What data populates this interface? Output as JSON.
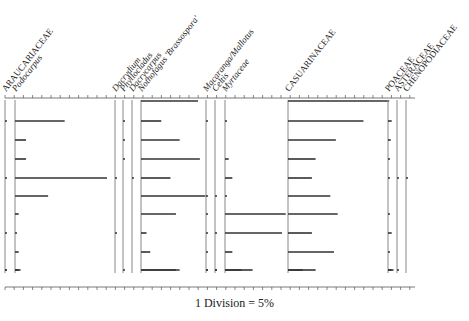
{
  "chart_data": {
    "type": "bar",
    "subtype": "pollen-diagram",
    "title": "",
    "scale_label": "1 Division = 5%",
    "division_percent": 5,
    "orientation": "horizontal bars per taxon column, samples stacked vertically",
    "samples": [
      "S1",
      "S2",
      "S3",
      "S4",
      "S5",
      "S6",
      "S7",
      "S8",
      "S9",
      "S10"
    ],
    "taxa": [
      {
        "name": "ARAUCARIACEAE",
        "style": "family",
        "values": [
          0,
          0.5,
          0,
          0,
          0.5,
          0,
          0,
          0.5,
          0,
          0.5,
          0.5
        ]
      },
      {
        "name": "Podocarpus",
        "style": "genus",
        "values": [
          0,
          27,
          6,
          6,
          50,
          18,
          2,
          0.5,
          2,
          3,
          2
        ]
      },
      {
        "name": "Dacrydium",
        "style": "genus",
        "values": [
          0,
          0,
          0,
          0,
          0.5,
          0,
          0,
          0.5,
          0,
          0,
          0
        ]
      },
      {
        "name": "Phyllocladus",
        "style": "genus",
        "values": [
          0,
          0.5,
          0.5,
          0.5,
          0,
          0,
          0,
          0,
          0,
          0.5,
          0
        ]
      },
      {
        "name": "Dacrycarpus",
        "style": "genus",
        "values": [
          0,
          0,
          0,
          0,
          0.5,
          0,
          0,
          0,
          0,
          0,
          0
        ]
      },
      {
        "name": "Nothofagus 'Brassospora'",
        "style": "genus",
        "values": [
          31,
          11,
          21,
          32,
          16,
          35,
          19,
          3,
          5,
          19,
          21
        ]
      },
      {
        "name": "Macaranga/Mallotus",
        "style": "genus",
        "values": [
          0,
          0.5,
          0,
          0,
          0,
          0.5,
          0.5,
          0.5,
          0.5,
          0.5,
          0.5
        ]
      },
      {
        "name": "Celtis",
        "style": "genus",
        "values": [
          0,
          0,
          0,
          0,
          0,
          0.5,
          0,
          0.5,
          0,
          0.5,
          0.5
        ]
      },
      {
        "name": "Myrtaceae",
        "style": "genus",
        "values": [
          0,
          0.5,
          0,
          2,
          4,
          0.5,
          33,
          31,
          4,
          15,
          9
        ]
      },
      {
        "name": "CASUARINACEAE",
        "style": "family",
        "values": [
          55,
          41,
          26,
          15,
          13,
          23,
          27,
          13,
          25,
          8,
          15
        ]
      },
      {
        "name": "POACEAE",
        "style": "family",
        "values": [
          0,
          2,
          1.5,
          1,
          1,
          0,
          1,
          2,
          1,
          2,
          3
        ]
      },
      {
        "name": "ASTERACEAE",
        "style": "family",
        "values": [
          0,
          0,
          0,
          0,
          0.5,
          0,
          0,
          0,
          0,
          0,
          0.5
        ]
      },
      {
        "name": "CHENOPODIACEAE",
        "style": "family",
        "values": [
          0,
          0,
          0,
          0,
          0.5,
          0,
          0,
          0,
          0,
          0,
          0
        ]
      }
    ],
    "xlabel": "1 Division = 5%",
    "ylabel": "",
    "grid": false,
    "legend": "none"
  },
  "caption": "1 Division = 5%"
}
